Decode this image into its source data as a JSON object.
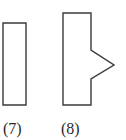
{
  "figures": [
    {
      "id": "7",
      "label": "(7)",
      "shape": "rectangle",
      "points": [
        [
          3,
          23
        ],
        [
          26,
          23
        ],
        [
          26,
          105
        ],
        [
          3,
          105
        ]
      ]
    },
    {
      "id": "8",
      "label": "(8)",
      "shape": "rectangle-with-triangular-notch",
      "points": [
        [
          63,
          13
        ],
        [
          91,
          13
        ],
        [
          91,
          50
        ],
        [
          114,
          65
        ],
        [
          91,
          79
        ],
        [
          91,
          105
        ],
        [
          63,
          105
        ]
      ]
    }
  ],
  "colors": {
    "stroke": "#3a3a3a",
    "background": "#ffffff"
  }
}
